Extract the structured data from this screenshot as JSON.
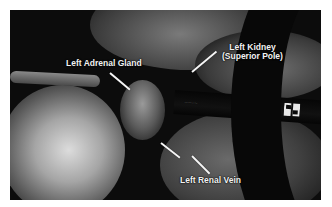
{
  "figure": {
    "labels": {
      "adrenal": "Left Adrenal Gland",
      "kidney_line1": "Left Kidney",
      "kidney_line2": "(Superior Pole)",
      "renal_vein": "Left Renal Vein"
    },
    "instrument": {
      "brand_text": "COVIDIEN",
      "logo": "covidien-logo"
    },
    "colors": {
      "background": "#ffffff",
      "photo_dark": "#0c0c0c",
      "label_text": "#f2f2f2"
    }
  }
}
